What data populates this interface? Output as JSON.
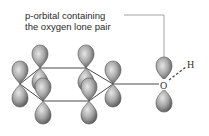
{
  "caption": {
    "line1": "p-orbital containing",
    "line2": "the oxygen lone pair"
  },
  "atoms": {
    "oxygen": "O",
    "hydrogen": "H"
  },
  "colors": {
    "lobe_light": "#d8d8d8",
    "lobe_dark": "#6e6e6e",
    "bond": "#4a4a4a",
    "leader_line": "#8a8a8a"
  }
}
